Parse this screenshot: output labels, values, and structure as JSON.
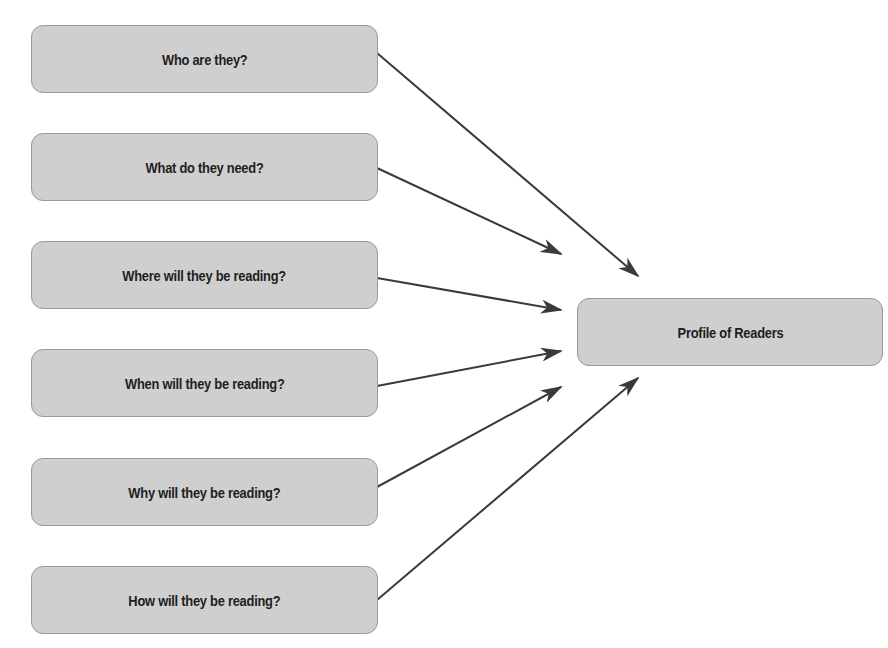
{
  "diagram": {
    "type": "flow",
    "colors": {
      "node_fill": "#cfcfcf",
      "node_border": "#9a9a9a",
      "text": "#1e1e1e",
      "arrow": "#3a3a3a"
    },
    "sources": [
      {
        "id": "n0",
        "label": "Who are they?"
      },
      {
        "id": "n1",
        "label": "What do they need?"
      },
      {
        "id": "n2",
        "label": "Where will they be reading?"
      },
      {
        "id": "n3",
        "label": "When will they be reading?"
      },
      {
        "id": "n4",
        "label": "Why will they be reading?"
      },
      {
        "id": "n5",
        "label": "How will they be reading?"
      }
    ],
    "target": {
      "id": "target",
      "label": "Profile of Readers"
    },
    "edges": [
      {
        "from": "n0",
        "to": "target"
      },
      {
        "from": "n1",
        "to": "target"
      },
      {
        "from": "n2",
        "to": "target"
      },
      {
        "from": "n3",
        "to": "target"
      },
      {
        "from": "n4",
        "to": "target"
      },
      {
        "from": "n5",
        "to": "target"
      }
    ]
  }
}
